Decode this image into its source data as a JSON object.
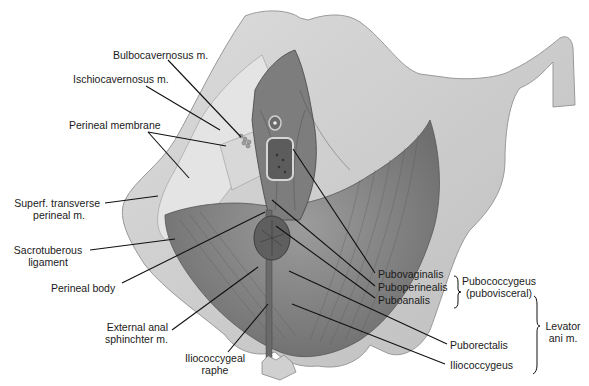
{
  "figure": {
    "labels": {
      "bulbocavernosus": "Bulbocavernosus m.",
      "ischiocavernosus": "Ischiocavernosus m.",
      "perineal_membrane": "Perineal membrane",
      "superf_transverse_1": "Superf. transverse",
      "superf_transverse_2": "perineal m.",
      "sacrotuberous_1": "Sacrotuberous",
      "sacrotuberous_2": "ligament",
      "perineal_body": "Perineal body",
      "ext_anal_1": "External anal",
      "ext_anal_2": "sphinchter m.",
      "iliococcygeal_raphe_1": "Iliococcygeal",
      "iliococcygeal_raphe_2": "raphe",
      "pubovaginalis": "Pubovaginalis",
      "puboperinealis": "Puboperinealis",
      "puboanalis": "Puboanalis",
      "pubococcygeus_1": "Pubococcygeus",
      "pubococcygeus_2": "(pubovisceral)",
      "puborectalis": "Puborectalis",
      "iliococcygeus": "Iliococcygeus",
      "levator_1": "Levator",
      "levator_2": "ani m."
    },
    "colors": {
      "bone": "#cfcfcf",
      "bone_edge": "#9a9a9a",
      "muscle": "#8a8a8a",
      "muscle_dark": "#5e5e5e",
      "leader": "#111111"
    }
  }
}
